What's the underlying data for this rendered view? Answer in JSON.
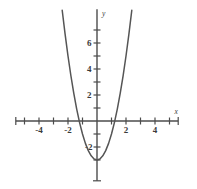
{
  "page": {
    "cut_top_text": "",
    "background_color": "#ffffff",
    "curve_color": "#555555",
    "axis_color": "#4c4c4c"
  },
  "chart_data": {
    "type": "line",
    "title": "",
    "subtitle": "",
    "xlabel": "x",
    "ylabel": "y",
    "grid": false,
    "legend": null,
    "equation": "y = 2x^2 - 3",
    "vertex": [
      0,
      -3
    ],
    "x_intercepts": [
      -1.22,
      1.22
    ],
    "y_intercept": -3,
    "xlim": [
      -5.6,
      5.6
    ],
    "ylim": [
      -4.2,
      8.6
    ],
    "xticks": [
      -5,
      -4,
      -3,
      -2,
      -1,
      1,
      2,
      3,
      4,
      5
    ],
    "xtick_labels": [
      "",
      "-4",
      "",
      "-2",
      "",
      "",
      "2",
      "",
      "4",
      ""
    ],
    "yticks": [
      1,
      2,
      3,
      4,
      5,
      6,
      7
    ],
    "ytick_labels": [
      "",
      "2",
      "",
      "4",
      "",
      "6",
      ""
    ],
    "neg_yticks": [
      -1,
      -2,
      -3
    ],
    "neg_ytick_labels": [
      "",
      "-2",
      ""
    ],
    "x": [
      -2.4,
      -2.2,
      -2.0,
      -1.8,
      -1.6,
      -1.4,
      -1.2,
      -1.0,
      -0.8,
      -0.6,
      -0.4,
      -0.2,
      0.0,
      0.2,
      0.4,
      0.6,
      0.8,
      1.0,
      1.2,
      1.4,
      1.6,
      1.8,
      2.0,
      2.2,
      2.4
    ],
    "y": [
      8.52,
      6.68,
      5.0,
      3.48,
      2.12,
      0.92,
      -0.12,
      -1.0,
      -1.72,
      -2.28,
      -2.68,
      -2.92,
      -3.0,
      -2.92,
      -2.68,
      -2.28,
      -1.72,
      -1.0,
      -0.12,
      0.92,
      2.12,
      3.48,
      5.0,
      6.68,
      8.52
    ],
    "series": [
      {
        "name": "y = 2x^2 - 3",
        "values": [
          8.52,
          6.68,
          5.0,
          3.48,
          2.12,
          0.92,
          -0.12,
          -1.0,
          -1.72,
          -2.28,
          -2.68,
          -2.92,
          -3.0,
          -2.92,
          -2.68,
          -2.28,
          -1.72,
          -1.0,
          -0.12,
          0.92,
          2.12,
          3.48,
          5.0,
          6.68,
          8.52
        ]
      }
    ]
  }
}
